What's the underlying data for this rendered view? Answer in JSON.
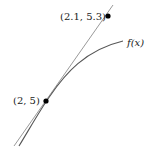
{
  "diagram": {
    "type": "tangent-line-approximation",
    "curve": {
      "label": "f(x)",
      "color": "#555555"
    },
    "tangent_line": {
      "color": "#999999"
    },
    "points": [
      {
        "label": "(2, 5)",
        "role": "point of tangency"
      },
      {
        "label": "(2.1, 5.3)",
        "role": "point on tangent line"
      }
    ]
  }
}
